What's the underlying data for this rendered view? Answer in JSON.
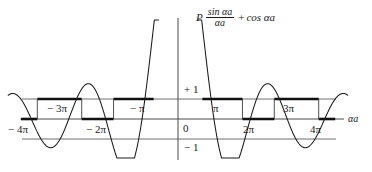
{
  "figure": {
    "background": "#ffffff",
    "ink": "#1a1a1a"
  },
  "formula": {
    "prefactor": "P",
    "numerator": "sin αa",
    "denominator": "αa",
    "operator": "+",
    "second_term": "cos αa",
    "plain": "P sin αa / αa + cos αa"
  },
  "axis": {
    "x_label": "αa",
    "origin_label": "0",
    "upper_bound_label": "+ 1",
    "lower_bound_label": "− 1",
    "x_ticks": [
      {
        "label": "− 4π",
        "value": -4,
        "side": "below"
      },
      {
        "label": "− 3π",
        "value": -3,
        "side": "above"
      },
      {
        "label": "− 2π",
        "value": -2,
        "side": "below"
      },
      {
        "label": "− π",
        "value": -1,
        "side": "above"
      },
      {
        "label": "0",
        "value": 0,
        "side": "below"
      },
      {
        "label": "π",
        "value": 1,
        "side": "above"
      },
      {
        "label": "2π",
        "value": 2,
        "side": "below"
      },
      {
        "label": "3π",
        "value": 3,
        "side": "above"
      },
      {
        "label": "4π",
        "value": 4,
        "side": "below"
      }
    ]
  },
  "chart_data": {
    "type": "line",
    "xlabel": "αa",
    "ylabel": "",
    "x_unit": "pi",
    "xlim": [
      -4.35,
      4.35
    ],
    "ylim": [
      -1.75,
      4.6
    ],
    "grid": false,
    "P": 10.5,
    "function": "P*sin(x)/x + cos(x)",
    "reference_lines": [
      {
        "y": 1,
        "label": "+ 1",
        "style": "thin"
      },
      {
        "y": 0,
        "label": "0",
        "style": "thin"
      },
      {
        "y": -1,
        "label": "− 1",
        "style": "thin"
      }
    ],
    "allowed_bands": [
      {
        "from": -4.0,
        "to": -3.58,
        "level": 0
      },
      {
        "from": -3.58,
        "to": -3.0,
        "level": 1
      },
      {
        "from": -3.0,
        "to": -2.45,
        "level": 1
      },
      {
        "from": -2.45,
        "to": -2.0,
        "level": 0
      },
      {
        "from": -2.0,
        "to": -1.64,
        "level": 0
      },
      {
        "from": -1.64,
        "to": -1.0,
        "level": 1
      },
      {
        "from": -1.0,
        "to": -0.62,
        "level": 1
      },
      {
        "from": 0.62,
        "to": 1.0,
        "level": 1
      },
      {
        "from": 1.0,
        "to": 1.64,
        "level": 1
      },
      {
        "from": 1.64,
        "to": 2.0,
        "level": 0
      },
      {
        "from": 2.0,
        "to": 2.45,
        "level": 0
      },
      {
        "from": 2.45,
        "to": 3.0,
        "level": 1
      },
      {
        "from": 3.0,
        "to": 3.58,
        "level": 1
      },
      {
        "from": 3.58,
        "to": 4.0,
        "level": 0
      }
    ],
    "series": [
      {
        "name": "P sin(αa)/(αa) + cos(αa)",
        "color": "#1a1a1a",
        "note": "central peak far above +1, decaying oscillations to both sides"
      }
    ],
    "key_points": [
      {
        "x": 0,
        "y": 4.5,
        "note": "central maximum, off scale top"
      },
      {
        "x": 1,
        "y": -1.0,
        "note": "crossing near pi"
      },
      {
        "x": 1.43,
        "y": -1.6,
        "note": "first negative minimum"
      },
      {
        "x": 2.0,
        "y": 1.0,
        "note": "near 2pi"
      },
      {
        "x": 2.46,
        "y": 1.45,
        "note": "second positive maximum"
      },
      {
        "x": 3.0,
        "y": -1.0,
        "note": "near 3pi"
      },
      {
        "x": 3.47,
        "y": -1.35,
        "note": "third negative minimum"
      },
      {
        "x": 4.0,
        "y": 1.0,
        "note": "near 4pi"
      }
    ]
  }
}
